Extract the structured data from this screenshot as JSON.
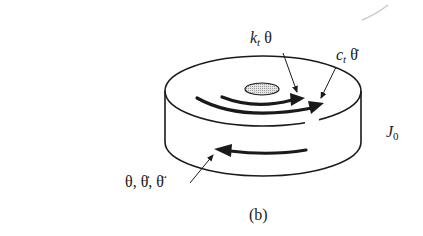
{
  "figure": {
    "caption": "(b)",
    "labels": {
      "stiffness": {
        "symbol": "k",
        "subscript": "t",
        "variable": "θ"
      },
      "damping": {
        "symbol": "c",
        "subscript": "t",
        "variable": "θ̇"
      },
      "inertia": {
        "symbol": "J",
        "subscript": "0"
      },
      "motion": {
        "text": "θ, θ̇, θ̈"
      }
    },
    "components": [
      "disk",
      "hub",
      "stiffness-torque-arrow",
      "damping-torque-arrow",
      "motion-arrow"
    ],
    "colors": {
      "stroke": "#1a1a1a",
      "hub_fill": "#c8c8c8",
      "background": "#ffffff"
    }
  }
}
